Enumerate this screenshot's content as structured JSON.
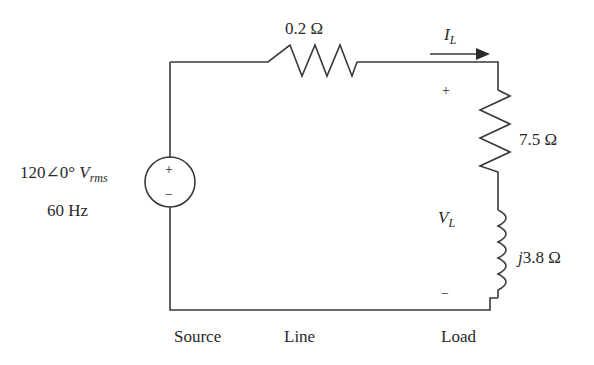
{
  "diagram": {
    "type": "circuit-schematic",
    "source": {
      "voltage_label": "120∠0°",
      "voltage_symbol": "V",
      "voltage_subscript": "rms",
      "frequency_label": "60 Hz",
      "plus_sign": "+",
      "minus_sign": "−"
    },
    "line": {
      "resistance_label": "0.2 Ω"
    },
    "current": {
      "symbol": "I",
      "subscript": "L"
    },
    "load": {
      "resistance_label": "7.5 Ω",
      "reactance_prefix": "j",
      "reactance_label": "3.8 Ω",
      "voltage_symbol": "V",
      "voltage_subscript": "L",
      "plus_sign": "+",
      "minus_sign": "−"
    },
    "section_labels": {
      "source": "Source",
      "line": "Line",
      "load": "Load"
    },
    "colors": {
      "wire": "#3a3a3a",
      "text": "#2a2a2a",
      "background": "#ffffff"
    }
  }
}
